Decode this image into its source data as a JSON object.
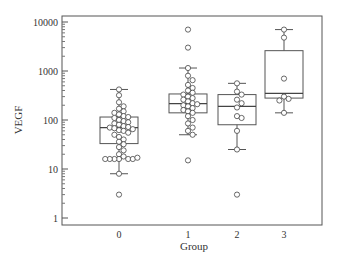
{
  "chart_data": {
    "type": "box",
    "title": "",
    "xlabel": "Group",
    "ylabel": "VEGF",
    "yscale": "log",
    "ylim": [
      0.85,
      13000
    ],
    "yticks": [
      1,
      10,
      100,
      1000,
      10000
    ],
    "ytick_labels": [
      "1",
      "10",
      "100",
      "1000",
      "10000"
    ],
    "categories": [
      "0",
      "1",
      "2",
      "3"
    ],
    "grid": false,
    "legend": null,
    "boxes": [
      {
        "group": "0",
        "whisker_low": 8,
        "q1": 33,
        "median": 70,
        "q3": 115,
        "whisker_high": 420
      },
      {
        "group": "1",
        "whisker_low": 50,
        "q1": 140,
        "median": 215,
        "q3": 340,
        "whisker_high": 1150
      },
      {
        "group": "2",
        "whisker_low": 25,
        "q1": 80,
        "median": 190,
        "q3": 330,
        "whisker_high": 560
      },
      {
        "group": "3",
        "whisker_low": 140,
        "q1": 280,
        "median": 350,
        "q3": 2600,
        "whisker_high": 7000
      }
    ],
    "points": {
      "0": [
        420,
        320,
        230,
        190,
        170,
        150,
        140,
        130,
        120,
        115,
        110,
        100,
        95,
        90,
        85,
        80,
        75,
        72,
        70,
        68,
        65,
        62,
        60,
        55,
        50,
        45,
        40,
        36,
        32,
        28,
        24,
        20,
        18,
        16,
        16,
        16,
        16,
        16,
        16,
        17,
        8,
        3
      ],
      "1": [
        7000,
        3000,
        1150,
        800,
        650,
        520,
        450,
        400,
        360,
        330,
        300,
        280,
        260,
        240,
        220,
        210,
        200,
        190,
        175,
        160,
        150,
        140,
        120,
        100,
        85,
        70,
        60,
        50,
        15
      ],
      "2": [
        560,
        380,
        330,
        260,
        220,
        180,
        120,
        110,
        60,
        25,
        3
      ],
      "3": [
        7000,
        4800,
        700,
        300,
        270,
        250,
        140
      ]
    }
  }
}
